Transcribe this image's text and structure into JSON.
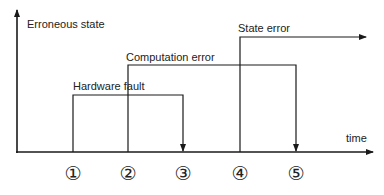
{
  "diagram": {
    "y_axis_label": "Erroneous state",
    "x_axis_label": "time",
    "line_color": "#1a1a1a",
    "background": "#ffffff",
    "events": [
      {
        "label": "Hardware fault",
        "start_marker": "1",
        "end_marker": "3",
        "ends_with": "down-arrow"
      },
      {
        "label": "Computation error",
        "start_marker": "2",
        "end_marker": "5",
        "ends_with": "down-arrow"
      },
      {
        "label": "State error",
        "start_marker": "4",
        "end_marker": null,
        "ends_with": "right-arrow-continuing"
      }
    ],
    "markers": [
      {
        "id": "1",
        "glyph": "①"
      },
      {
        "id": "2",
        "glyph": "②"
      },
      {
        "id": "3",
        "glyph": "③"
      },
      {
        "id": "4",
        "glyph": "④"
      },
      {
        "id": "5",
        "glyph": "⑤"
      }
    ]
  }
}
